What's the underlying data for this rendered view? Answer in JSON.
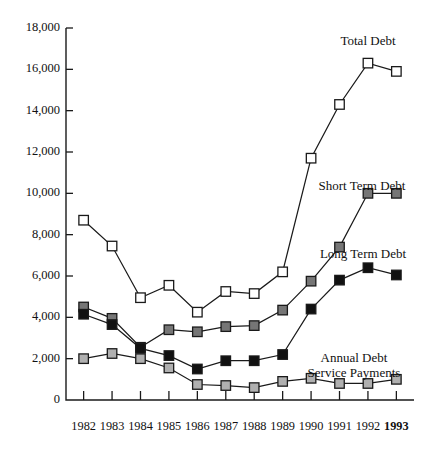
{
  "chart_data": {
    "type": "line",
    "title": "",
    "subtitle": "",
    "xlabel": "",
    "ylabel": "",
    "categories": [
      "1982",
      "1983",
      "1984",
      "1985",
      "1986",
      "1987",
      "1988",
      "1989",
      "1990",
      "1991",
      "1992",
      "1993"
    ],
    "x_tick_labels": [
      "1982",
      "1983",
      "1984",
      "1985",
      "1986",
      "1987",
      "1988",
      "1989",
      "1990",
      "1991",
      "1992",
      "1993"
    ],
    "x_tick_emphasis": [
      false,
      false,
      false,
      false,
      false,
      false,
      false,
      false,
      false,
      false,
      false,
      true
    ],
    "y_tick_labels": [
      "0",
      "2,000",
      "4,000",
      "6,000",
      "8,000",
      "10,000",
      "12,000",
      "14,000",
      "16,000",
      "18,000"
    ],
    "y_tick_values": [
      0,
      2000,
      4000,
      6000,
      8000,
      10000,
      12000,
      14000,
      16000,
      18000
    ],
    "ylim": [
      0,
      18000
    ],
    "grid": false,
    "legend": "inline-annotations",
    "series": [
      {
        "name": "Total Debt",
        "label": "Total Debt",
        "marker": "square-open",
        "marker_fill": "#ffffff",
        "marker_stroke": "#1a1a1a",
        "values": [
          8700,
          7450,
          4950,
          5550,
          4250,
          5250,
          5150,
          6200,
          11700,
          14300,
          16300,
          15900
        ]
      },
      {
        "name": "Short Term Debt",
        "label": "Short Term Debt",
        "marker": "square-filled",
        "marker_fill": "#767676",
        "marker_stroke": "#1a1a1a",
        "values": [
          4500,
          3950,
          2550,
          3400,
          3300,
          3550,
          3600,
          4350,
          5750,
          7400,
          10000,
          10000
        ]
      },
      {
        "name": "Long Term Debt",
        "label": "Long Term Debt",
        "marker": "square-filled",
        "marker_fill": "#111111",
        "marker_stroke": "#1a1a1a",
        "values": [
          4150,
          3650,
          2500,
          2150,
          1500,
          1900,
          1900,
          2200,
          4400,
          5800,
          6400,
          6050
        ]
      },
      {
        "name": "Annual Debt Service Payments",
        "label": "Annual Debt\nService Payments",
        "label_line_1": "Annual Debt",
        "label_line_2": "Service Payments",
        "marker": "square-filled",
        "marker_fill": "#b0b0b0",
        "marker_stroke": "#1a1a1a",
        "values": [
          2000,
          2250,
          2000,
          1550,
          750,
          700,
          600,
          900,
          1050,
          800,
          800,
          1000
        ]
      }
    ],
    "annotations": [
      {
        "text": "Total Debt",
        "series": "Total Debt"
      },
      {
        "text": "Short Term Debt",
        "series": "Short Term Debt"
      },
      {
        "text": "Long Term Debt",
        "series": "Long Term Debt"
      },
      {
        "text": "Annual Debt Service Payments",
        "series": "Annual Debt Service Payments"
      }
    ]
  },
  "colors": {
    "axis": "#1a1a1a",
    "background": "#ffffff",
    "total_debt": "#ffffff",
    "short_term_debt": "#767676",
    "long_term_debt": "#111111",
    "annual_debt_service": "#b0b0b0"
  }
}
